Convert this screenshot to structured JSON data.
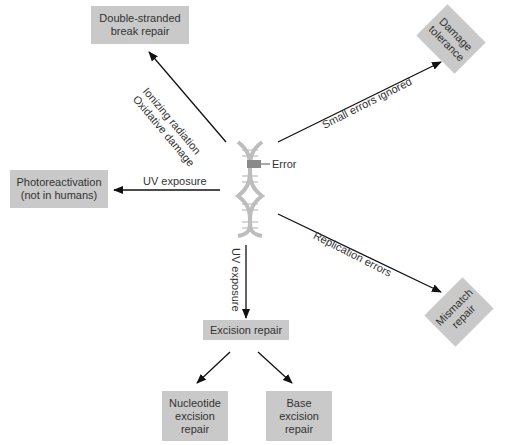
{
  "center": {
    "label": "Error"
  },
  "boxes": {
    "double_strand": "Double-stranded\nbreak repair",
    "damage_tolerance": "Damage\ntolerance",
    "photoreactivation": "Photoreactivation\n(not in humans)",
    "mismatch": "Mismatch\nrepair",
    "excision": "Excision repair",
    "nucleotide": "Nucleotide\nexcision\nrepair",
    "base": "Base\nexcision\nrepair"
  },
  "edges": {
    "ionizing": "Ionizing radiation",
    "oxidative": "Oxidative damage",
    "small_errors": "Small errors ignored",
    "uv_left": "UV exposure",
    "uv_down": "UV exposure",
    "replication": "Replication errors"
  },
  "colors": {
    "box": "#c9c9c9",
    "arrow": "#111111",
    "error_mark": "#8a8a8a",
    "dna": "#bdbdbd"
  }
}
